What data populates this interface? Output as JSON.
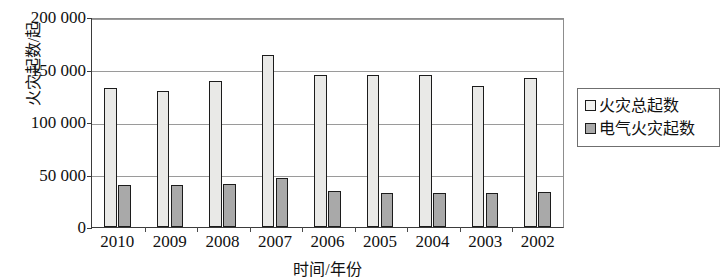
{
  "chart_data": {
    "type": "bar",
    "title": "",
    "xlabel": "时间/年份",
    "ylabel": "火灾起数/起",
    "categories": [
      "2010",
      "2009",
      "2008",
      "2007",
      "2006",
      "2005",
      "2004",
      "2003",
      "2002"
    ],
    "ylim": [
      0,
      200000
    ],
    "yticks": [
      0,
      50000,
      100000,
      150000,
      200000
    ],
    "ytick_labels": [
      "0",
      "50 000",
      "100 000",
      "150 000",
      "200 000"
    ],
    "grid": true,
    "legend_position": "right",
    "series": [
      {
        "name": "火灾总起数",
        "color": "#e9e9e7",
        "values": [
          132000,
          130000,
          139000,
          164000,
          145000,
          145000,
          145000,
          134000,
          142000
        ]
      },
      {
        "name": "电气火灾起数",
        "color": "#a9a9a9",
        "values": [
          40000,
          40000,
          41000,
          47000,
          34000,
          32000,
          32000,
          32000,
          33000
        ]
      }
    ]
  },
  "legend": {
    "items": [
      {
        "label": "火灾总起数",
        "swatch": "total"
      },
      {
        "label": "电气火灾起数",
        "swatch": "electric"
      }
    ]
  }
}
